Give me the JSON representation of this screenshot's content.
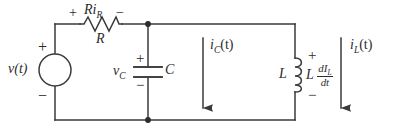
{
  "figure": {
    "background_color": "#ffffff",
    "line_color": "#3a3a3a",
    "text_color": "#2b2b2b",
    "width": 393,
    "height": 134
  },
  "source": {
    "label": "v(t)",
    "plus": "+",
    "minus": "−",
    "type": "independent-voltage-source"
  },
  "resistor": {
    "value_label": "R",
    "voltage_label_R": "R",
    "voltage_label_i": "i",
    "voltage_label_i_sub": "R",
    "plus": "+",
    "minus": "−"
  },
  "capacitor": {
    "value_label": "C",
    "voltage_label": "v",
    "voltage_label_sub": "C",
    "plus": "+",
    "minus": "−"
  },
  "inductor": {
    "value_label": "L",
    "voltage_L": "L",
    "voltage_numerator_d": "d",
    "voltage_numerator_I": "I",
    "voltage_numerator_sub": "L",
    "voltage_denominator_d": "d",
    "voltage_denominator_t": "t",
    "plus": "+",
    "minus": "−"
  },
  "currents": [
    {
      "name": "capacitor-branch-current",
      "symbol": "i",
      "subscript": "C",
      "arg": "(t)",
      "direction": "down"
    },
    {
      "name": "inductor-branch-current",
      "symbol": "i",
      "subscript": "L",
      "arg": "(t)",
      "direction": "down"
    }
  ],
  "nodes": [
    {
      "name": "top-node",
      "label": ""
    },
    {
      "name": "bottom-node",
      "label": ""
    }
  ]
}
